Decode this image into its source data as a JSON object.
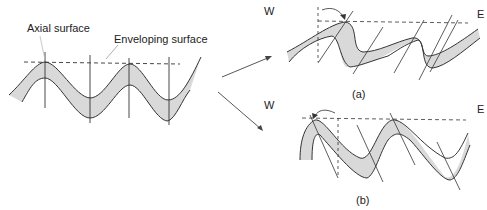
{
  "labels": {
    "axial_surface": "Axial surface",
    "enveloping_surface": "Enveloping surface",
    "west_a": "W",
    "east_a": "E",
    "west_b": "W",
    "east_b": "E",
    "caption_a": "(a)",
    "caption_b": "(b)"
  },
  "colors": {
    "layer_fill": "#d9d9d9",
    "line": "#333333"
  }
}
